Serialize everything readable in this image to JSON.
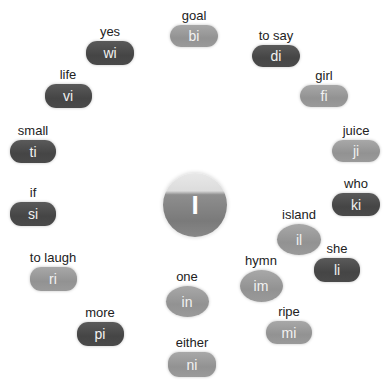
{
  "center": {
    "letter": "I"
  },
  "colors": {
    "dark": "#4a4a4a",
    "light": "#999999",
    "text": "#f2f2f2"
  },
  "nodes": [
    {
      "word": "goal",
      "syllable": "bi",
      "tone": "light",
      "shape": "pill"
    },
    {
      "word": "to say",
      "syllable": "di",
      "tone": "dark",
      "shape": "pill"
    },
    {
      "word": "girl",
      "syllable": "fi",
      "tone": "light",
      "shape": "pill"
    },
    {
      "word": "juice",
      "syllable": "ji",
      "tone": "light",
      "shape": "pill"
    },
    {
      "word": "who",
      "syllable": "ki",
      "tone": "dark",
      "shape": "pill"
    },
    {
      "word": "she",
      "syllable": "li",
      "tone": "dark",
      "shape": "pill"
    },
    {
      "word": "island",
      "syllable": "il",
      "tone": "light",
      "shape": "oval"
    },
    {
      "word": "ripe",
      "syllable": "mi",
      "tone": "light",
      "shape": "pill"
    },
    {
      "word": "hymn",
      "syllable": "im",
      "tone": "light",
      "shape": "oval"
    },
    {
      "word": "one",
      "syllable": "in",
      "tone": "light",
      "shape": "oval"
    },
    {
      "word": "either",
      "syllable": "ni",
      "tone": "light",
      "shape": "pill"
    },
    {
      "word": "more",
      "syllable": "pi",
      "tone": "dark",
      "shape": "pill"
    },
    {
      "word": "to laugh",
      "syllable": "ri",
      "tone": "light",
      "shape": "pill"
    },
    {
      "word": "if",
      "syllable": "si",
      "tone": "dark",
      "shape": "pill"
    },
    {
      "word": "small",
      "syllable": "ti",
      "tone": "dark",
      "shape": "pill"
    },
    {
      "word": "life",
      "syllable": "vi",
      "tone": "dark",
      "shape": "pill"
    },
    {
      "word": "yes",
      "syllable": "wi",
      "tone": "dark",
      "shape": "pill"
    }
  ]
}
